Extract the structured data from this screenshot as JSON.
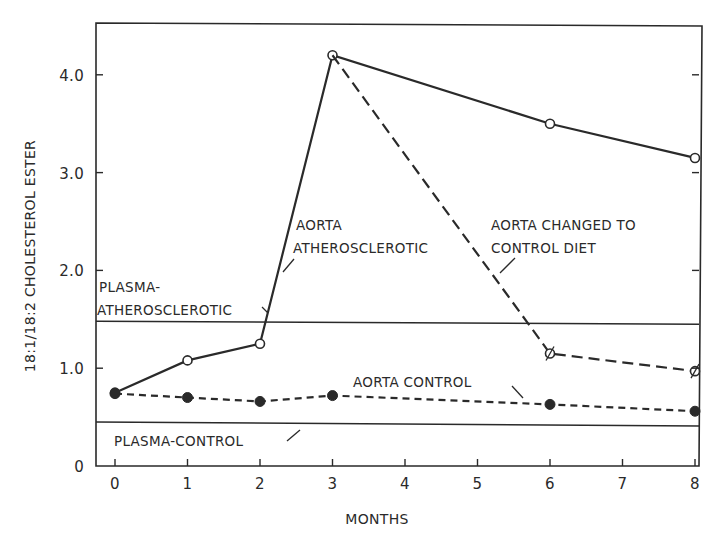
{
  "chart_data": {
    "type": "line",
    "title": "",
    "xlabel": "MONTHS",
    "ylabel": "18:1/18:2 CHOLESTEROL ESTER",
    "xlim": [
      -0.25,
      8.0
    ],
    "ylim": [
      0,
      4.45
    ],
    "x_ticks": [
      0,
      1,
      2,
      3,
      4,
      5,
      6,
      7,
      8
    ],
    "x_tick_labels": [
      "0",
      "1",
      "2",
      "3",
      "4",
      "5",
      "6",
      "7",
      "8"
    ],
    "y_ticks": [
      0,
      1.0,
      2.0,
      3.0,
      4.0
    ],
    "y_tick_labels": [
      "0",
      "1.0",
      "2.0",
      "3.0",
      "4.0"
    ],
    "grid": false,
    "legend": "none (inline annotations)",
    "series": [
      {
        "name": "AORTA ATHEROSCLEROTIC",
        "style": "solid",
        "marker": "open-circle",
        "x": [
          0,
          1,
          2,
          3,
          6,
          8
        ],
        "values": [
          0.75,
          1.08,
          1.25,
          4.2,
          3.5,
          3.15
        ]
      },
      {
        "name": "AORTA CHANGED TO CONTROL DIET",
        "style": "long-dash",
        "marker": "slashed-circle",
        "x": [
          3,
          6,
          8
        ],
        "values": [
          4.2,
          1.15,
          0.97
        ]
      },
      {
        "name": "AORTA CONTROL",
        "style": "short-dash",
        "marker": "filled-circle",
        "x": [
          0,
          1,
          2,
          3,
          6,
          8
        ],
        "values": [
          0.74,
          0.7,
          0.66,
          0.72,
          0.63,
          0.56
        ]
      },
      {
        "name": "PLASMA-ATHEROSCLEROTIC",
        "style": "solid-reference-line",
        "marker": "none",
        "x": [
          -0.25,
          8
        ],
        "values": [
          1.48,
          1.45
        ]
      },
      {
        "name": "PLASMA-CONTROL",
        "style": "solid-reference-line",
        "marker": "none",
        "x": [
          -0.25,
          8
        ],
        "values": [
          0.45,
          0.41
        ]
      }
    ],
    "annotations": [
      {
        "text": [
          "AORTA",
          "ATHEROSCLEROTIC"
        ],
        "target": "AORTA ATHEROSCLEROTIC"
      },
      {
        "text": [
          "AORTA CHANGED TO",
          "CONTROL DIET"
        ],
        "target": "AORTA CHANGED TO CONTROL DIET"
      },
      {
        "text": [
          "AORTA CONTROL"
        ],
        "target": "AORTA CONTROL"
      },
      {
        "text": [
          "PLASMA-",
          "ATHEROSCLEROTIC"
        ],
        "target": "PLASMA-ATHEROSCLEROTIC"
      },
      {
        "text": [
          "PLASMA-CONTROL"
        ],
        "target": "PLASMA-CONTROL"
      }
    ]
  },
  "labels": {
    "xlabel": "MONTHS",
    "ylabel": "18:1/18:2 CHOLESTEROL ESTER",
    "ann_aorta_ath_1": "AORTA",
    "ann_aorta_ath_2": "ATHEROSCLEROTIC",
    "ann_changed_1": "AORTA CHANGED TO",
    "ann_changed_2": "CONTROL DIET",
    "ann_aorta_control": "AORTA CONTROL",
    "ann_plasma_ath_1": "PLASMA-",
    "ann_plasma_ath_2": "ATHEROSCLEROTIC",
    "ann_plasma_control": "PLASMA-CONTROL"
  },
  "colors": {
    "ink": "#2a2a2a",
    "background": "#ffffff"
  }
}
